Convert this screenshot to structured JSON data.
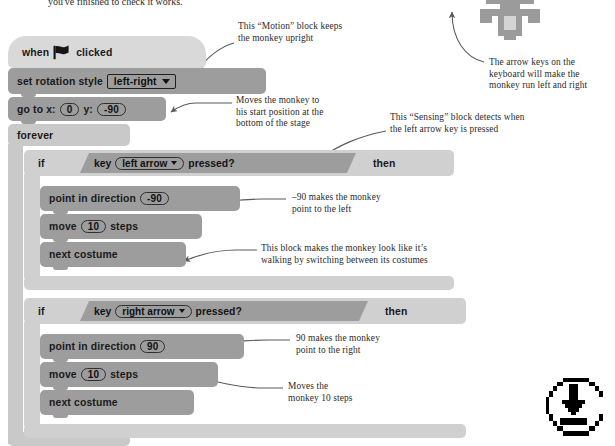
{
  "page": {
    "top_cut_text": "you've finished to check it works."
  },
  "script": {
    "blocks": [
      {
        "id": "hat",
        "type": "hat",
        "label": "when",
        "label2": "clicked",
        "icon": "green-flag-icon"
      },
      {
        "id": "rotation",
        "type": "motion",
        "label": "set rotation style",
        "field": "left-right"
      },
      {
        "id": "goto",
        "type": "motion",
        "label_a": "go to x:",
        "x": "0",
        "label_b": "y:",
        "y": "-90"
      },
      {
        "id": "forever",
        "type": "control",
        "label": "forever"
      },
      {
        "id": "if1",
        "type": "control",
        "label": "if",
        "then": "then"
      },
      {
        "id": "sense1",
        "type": "sensing",
        "label_a": "key",
        "field": "left arrow",
        "label_b": "pressed?"
      },
      {
        "id": "dir1",
        "type": "motion",
        "label": "point in direction",
        "value": "-90"
      },
      {
        "id": "move1",
        "type": "motion",
        "label_a": "move",
        "value": "10",
        "label_b": "steps"
      },
      {
        "id": "cost1",
        "type": "motion",
        "label": "next costume"
      },
      {
        "id": "if2",
        "type": "control",
        "label": "if",
        "then": "then"
      },
      {
        "id": "sense2",
        "type": "sensing",
        "label_a": "key",
        "field": "right arrow",
        "label_b": "pressed?"
      },
      {
        "id": "dir2",
        "type": "motion",
        "label": "point in direction",
        "value": "90"
      },
      {
        "id": "move2",
        "type": "motion",
        "label_a": "move",
        "value": "10",
        "label_b": "steps"
      },
      {
        "id": "cost2",
        "type": "motion",
        "label": "next costume"
      }
    ]
  },
  "annotations": [
    {
      "id": "note-motion-upright",
      "text": "This “Motion” block keeps\nthe monkey upright"
    },
    {
      "id": "note-arrow-keys",
      "text": "The arrow keys on the\nkeyboard will make the\nmonkey run left and right"
    },
    {
      "id": "note-start-position",
      "text": "Moves the monkey to\nhis start position at the\nbottom of the stage"
    },
    {
      "id": "note-sensing",
      "text": "This “Sensing” block detects when\nthe left arrow key is pressed"
    },
    {
      "id": "note-minus90",
      "text": "–90 makes the monkey\npoint to the left"
    },
    {
      "id": "note-costume",
      "text": "This block makes the monkey look like it’s\nwalking by switching between its costumes"
    },
    {
      "id": "note-plus90",
      "text": "90 makes the monkey\npoint to the right"
    },
    {
      "id": "note-move-steps",
      "text": "Moves the\nmonkey 10 steps"
    }
  ],
  "icons": {
    "monkey_figure": "pixel-monkey-figure",
    "download": "download-icon"
  },
  "colors": {
    "hat_block": "#d9d9d9",
    "motion_block": "#9d9d9d",
    "control_block": "#c9c9c9",
    "text": "#231f20",
    "page_bg": "#ffffff"
  }
}
